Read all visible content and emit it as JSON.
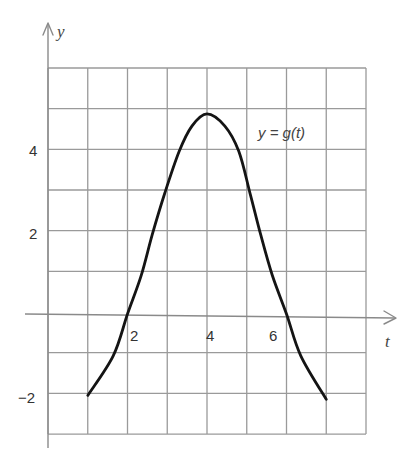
{
  "chart_data": {
    "type": "line",
    "title": "",
    "xlabel": "t",
    "ylabel": "y",
    "xlim": [
      0,
      8
    ],
    "ylim": [
      -3,
      6
    ],
    "grid": true,
    "grid_step": 1,
    "x_ticks": [
      {
        "value": 2,
        "label": "2"
      },
      {
        "value": 4,
        "label": "4"
      },
      {
        "value": 6,
        "label": "6"
      }
    ],
    "y_ticks": [
      {
        "value": 4,
        "label": "4"
      },
      {
        "value": 2,
        "label": "2"
      },
      {
        "value": -2,
        "label": "−2"
      }
    ],
    "series": [
      {
        "name": "y = g(t)",
        "color": "#141414",
        "points": [
          [
            1.0,
            -2.0
          ],
          [
            1.64,
            -1.03
          ],
          [
            2.0,
            0.0
          ],
          [
            2.34,
            0.93
          ],
          [
            2.62,
            1.94
          ],
          [
            2.94,
            2.98
          ],
          [
            3.3,
            4.0
          ],
          [
            3.62,
            4.62
          ],
          [
            4.0,
            4.92
          ],
          [
            4.45,
            4.62
          ],
          [
            4.8,
            4.0
          ],
          [
            5.08,
            2.98
          ],
          [
            5.35,
            1.95
          ],
          [
            5.64,
            0.96
          ],
          [
            6.0,
            0.0
          ],
          [
            6.36,
            -1.03
          ],
          [
            7.0,
            -2.1
          ]
        ]
      }
    ],
    "annotations": [
      {
        "text": "y = g(t)",
        "t": 5.3,
        "y": 4.4
      }
    ],
    "key_features": {
      "maximum": {
        "t": 4,
        "y": 4.9
      },
      "zeros": [
        2,
        6
      ],
      "start": {
        "t": 1,
        "y": -2
      },
      "end": {
        "t": 7,
        "y": -2
      }
    }
  },
  "labels": {
    "x_axis_title": "t",
    "y_axis_title": "y",
    "curve_label": "y = g(t)",
    "x_tick_2": "2",
    "x_tick_4": "4",
    "x_tick_6": "6",
    "y_tick_4": "4",
    "y_tick_2": "2",
    "y_tick_neg2": "−2"
  },
  "colors": {
    "grid": "#9a9a9a",
    "axis": "#8a8a8a",
    "curve": "#141414",
    "background": "#ffffff"
  }
}
